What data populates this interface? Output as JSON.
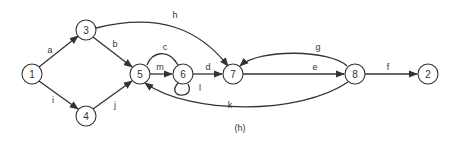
{
  "caption": "(h)",
  "nodes": [
    {
      "id": "1",
      "label": "1"
    },
    {
      "id": "3",
      "label": "3"
    },
    {
      "id": "4",
      "label": "4"
    },
    {
      "id": "5",
      "label": "5"
    },
    {
      "id": "6",
      "label": "6"
    },
    {
      "id": "7",
      "label": "7"
    },
    {
      "id": "8",
      "label": "8"
    },
    {
      "id": "2",
      "label": "2"
    }
  ],
  "edges": [
    {
      "id": "a",
      "label": "a",
      "from": "1",
      "to": "3"
    },
    {
      "id": "i",
      "label": "i",
      "from": "1",
      "to": "4"
    },
    {
      "id": "b",
      "label": "b",
      "from": "3",
      "to": "5"
    },
    {
      "id": "j",
      "label": "j",
      "from": "4",
      "to": "5"
    },
    {
      "id": "h",
      "label": "h",
      "from": "3",
      "to": "7"
    },
    {
      "id": "c",
      "label": "c",
      "from": "6",
      "to": "5"
    },
    {
      "id": "m",
      "label": "m",
      "from": "5",
      "to": "6"
    },
    {
      "id": "l",
      "label": "l",
      "from": "6",
      "to": "6"
    },
    {
      "id": "d",
      "label": "d",
      "from": "6",
      "to": "7"
    },
    {
      "id": "e",
      "label": "e",
      "from": "7",
      "to": "8"
    },
    {
      "id": "g",
      "label": "g",
      "from": "8",
      "to": "7"
    },
    {
      "id": "k",
      "label": "k",
      "from": "8",
      "to": "5"
    },
    {
      "id": "f",
      "label": "f",
      "from": "8",
      "to": "2"
    }
  ]
}
